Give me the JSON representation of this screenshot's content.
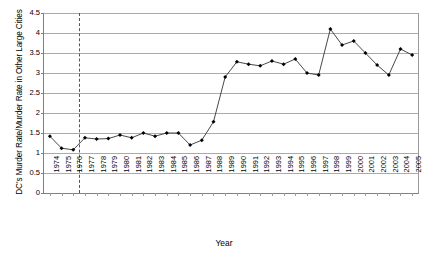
{
  "chart_data": {
    "type": "line",
    "title": "",
    "xlabel": "Year",
    "ylabel": "DC's Murder Rate/Murder Rate in Other Large Cities",
    "ylim": [
      0,
      4.5
    ],
    "yticks": [
      0,
      0.5,
      1,
      1.5,
      2,
      2.5,
      3,
      3.5,
      4,
      4.5
    ],
    "ytick_labels": [
      "0",
      "0.5",
      "1",
      "1.5",
      "2",
      "2.5",
      "3",
      "3.5",
      "4",
      "4.5"
    ],
    "grid": true,
    "legend": "none",
    "marker": "diamond",
    "line_color": "#333333",
    "marker_color": "#000000",
    "grid_color": "#aaaaaa",
    "annotations": [
      {
        "name": "vertical-dashed-line",
        "x": 1976.5,
        "style": "dashed",
        "color": "#555555"
      }
    ],
    "categories": [
      "1974",
      "1975",
      "1976",
      "1977",
      "1978",
      "1979",
      "1980",
      "1981",
      "1982",
      "1983",
      "1984",
      "1985",
      "1986",
      "1987",
      "1988",
      "1989",
      "1990",
      "1991",
      "1992",
      "1993",
      "1994",
      "1995",
      "1996",
      "1997",
      "1998",
      "1999",
      "2000",
      "2001",
      "2002",
      "2003",
      "2004",
      "2005"
    ],
    "x": [
      1974,
      1975,
      1976,
      1977,
      1978,
      1979,
      1980,
      1981,
      1982,
      1983,
      1984,
      1985,
      1986,
      1987,
      1988,
      1989,
      1990,
      1991,
      1992,
      1993,
      1994,
      1995,
      1996,
      1997,
      1998,
      1999,
      2000,
      2001,
      2002,
      2003,
      2004,
      2005
    ],
    "values": [
      1.42,
      1.12,
      1.08,
      1.38,
      1.35,
      1.36,
      1.45,
      1.38,
      1.5,
      1.42,
      1.5,
      1.5,
      1.2,
      1.32,
      1.78,
      2.9,
      3.28,
      3.22,
      3.18,
      3.3,
      3.22,
      3.35,
      3.0,
      2.95,
      4.1,
      3.7,
      3.8,
      3.5,
      3.2,
      2.95,
      3.6,
      3.45
    ],
    "values_note": "estimated from axis gridlines"
  },
  "axis": {
    "xlabel": "Year",
    "ylabel": "DC's Murder Rate/Murder Rate in Other Large Cities"
  }
}
